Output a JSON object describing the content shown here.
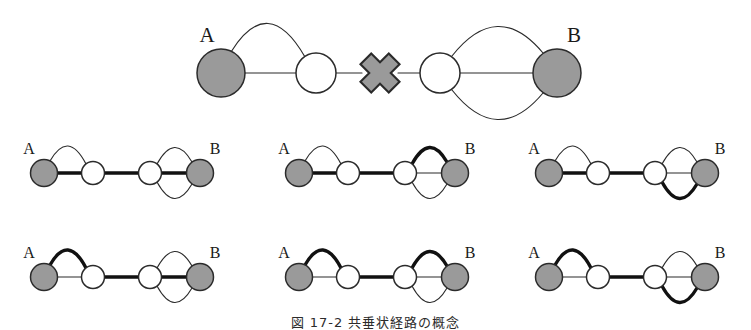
{
  "figure": {
    "caption": "図 17-2  共垂状経路の概念",
    "node_label_a": "A",
    "node_label_b": "B",
    "colors": {
      "terminal_node_fill": "#9a9a9a",
      "intermediate_node_fill": "#ffffff",
      "node_stroke": "#2b2b2b",
      "edge_stroke": "#2b2b2b",
      "highlight_stroke": "#111111",
      "cross_fill": "#9a9a9a",
      "cross_stroke": "#2b2b2b",
      "background": "#ffffff"
    }
  },
  "top_diagram": {
    "name": "broken-link-overview",
    "left_cluster": {
      "source_label": "A",
      "source_type": "terminal",
      "target_type": "intermediate",
      "parallel_edges": 2,
      "edge_shapes": [
        "top-arc",
        "straight"
      ]
    },
    "break_marker": {
      "symbol": "x-cross",
      "meaning": "link-broken"
    },
    "right_cluster": {
      "source_type": "intermediate",
      "target_label": "B",
      "target_type": "terminal",
      "parallel_edges": 3,
      "edge_shapes": [
        "top-arc",
        "straight",
        "bottom-arc"
      ]
    }
  },
  "path_enumeration": {
    "rows": 2,
    "cols": 3,
    "total_paths": 6,
    "graphs": [
      {
        "index": 1,
        "row": 1,
        "col": 1,
        "label_a": "A",
        "label_b": "B",
        "highlighted_left_edge": "straight",
        "highlighted_middle_edge": "straight",
        "highlighted_right_edge": "straight"
      },
      {
        "index": 2,
        "row": 1,
        "col": 2,
        "label_a": "A",
        "label_b": "B",
        "highlighted_left_edge": "straight",
        "highlighted_middle_edge": "straight",
        "highlighted_right_edge": "top-arc"
      },
      {
        "index": 3,
        "row": 1,
        "col": 3,
        "label_a": "A",
        "label_b": "B",
        "highlighted_left_edge": "straight",
        "highlighted_middle_edge": "straight",
        "highlighted_right_edge": "bottom-arc"
      },
      {
        "index": 4,
        "row": 2,
        "col": 1,
        "label_a": "A",
        "label_b": "B",
        "highlighted_left_edge": "top-arc",
        "highlighted_middle_edge": "straight",
        "highlighted_right_edge": "straight"
      },
      {
        "index": 5,
        "row": 2,
        "col": 2,
        "label_a": "A",
        "label_b": "B",
        "highlighted_left_edge": "top-arc",
        "highlighted_middle_edge": "straight",
        "highlighted_right_edge": "top-arc"
      },
      {
        "index": 6,
        "row": 2,
        "col": 3,
        "label_a": "A",
        "label_b": "B",
        "highlighted_left_edge": "top-arc",
        "highlighted_middle_edge": "straight",
        "highlighted_right_edge": "bottom-arc"
      }
    ]
  }
}
